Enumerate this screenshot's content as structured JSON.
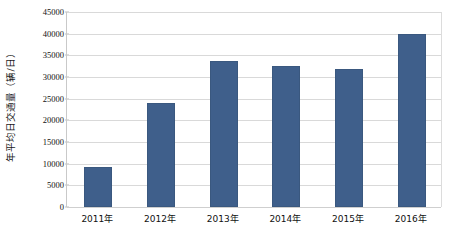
{
  "chart_data": {
    "type": "bar",
    "title": "",
    "subtitle": "",
    "xlabel": "",
    "ylabel": "年平均日交通量（辆/日）",
    "categories": [
      "2011年",
      "2012年",
      "2013年",
      "2014年",
      "2015年",
      "2016年"
    ],
    "values": [
      9300,
      24100,
      33700,
      32500,
      31800,
      40000
    ],
    "series": [
      {
        "name": "年平均日交通量",
        "values": [
          9300,
          24100,
          33700,
          32500,
          31800,
          40000
        ]
      }
    ],
    "ylim": [
      0,
      45000
    ],
    "ytick_values": [
      0,
      5000,
      10000,
      15000,
      20000,
      25000,
      30000,
      35000,
      40000,
      45000
    ],
    "ytick_labels": [
      "0",
      "5000",
      "10000",
      "15000",
      "20000",
      "25000",
      "30000",
      "35000",
      "40000",
      "45000"
    ],
    "grid": true,
    "grid_axis": "y",
    "legend": false,
    "legend_position": "none",
    "bar_color": "#3f5f8b",
    "grid_color": "#d9d9d9",
    "background_color": "#ffffff",
    "text_color": "#111111",
    "annotations": []
  }
}
